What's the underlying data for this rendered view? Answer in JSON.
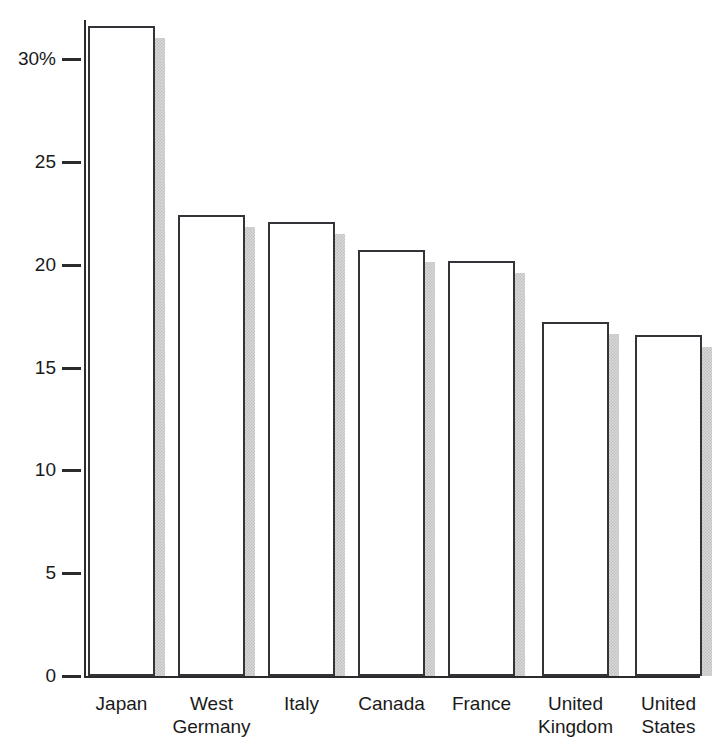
{
  "chart_data": {
    "type": "bar",
    "title": "",
    "subtitle": "",
    "xlabel": "",
    "ylabel": "",
    "categories": [
      "Japan",
      "West\nGermany",
      "Italy",
      "Canada",
      "France",
      "United\nKingdom",
      "United\nStates"
    ],
    "values": [
      31.6,
      22.4,
      22.1,
      20.7,
      20.2,
      17.2,
      16.6
    ],
    "ylim": [
      0,
      32.5
    ],
    "ytick_values": [
      0,
      5,
      10,
      15,
      20,
      25,
      30
    ],
    "ytick_labels": [
      "0",
      "5",
      "10",
      "15",
      "20",
      "25",
      "30%"
    ],
    "grid": false,
    "legend": null,
    "series": [
      {
        "name": "",
        "values": [
          31.6,
          22.4,
          22.1,
          20.7,
          20.2,
          17.2,
          16.6
        ]
      }
    ],
    "style": {
      "bar_fill": "#ffffff",
      "bar_outline": "#33333a",
      "bar_shadow": "#b9b9b9",
      "axis_color": "#2b2b2b",
      "text_color": "#1a1a1a",
      "background": "#ffffff"
    }
  }
}
